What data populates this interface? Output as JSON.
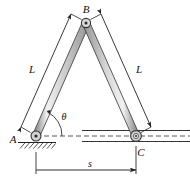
{
  "figure": {
    "type": "mechanism-diagram",
    "title": "",
    "labels": {
      "apex_joint": "B",
      "pin_joint": "A",
      "roller_joint": "C",
      "link_left_length": "L",
      "link_right_length": "L",
      "angle": "θ",
      "span": "s"
    },
    "colors": {
      "link_fill": "#c9c9c9",
      "link_edge": "#3a3a3a",
      "link_highlight": "#eaeaea",
      "line": "#222222",
      "dashed": "#444444",
      "hatch": "#333333",
      "text": "#111111"
    },
    "geometry": {
      "point_A": [
        36,
        136
      ],
      "point_B": [
        86,
        23
      ],
      "point_C": [
        136,
        136
      ],
      "link_width": 6,
      "angle_arc_radius": 26
    }
  }
}
